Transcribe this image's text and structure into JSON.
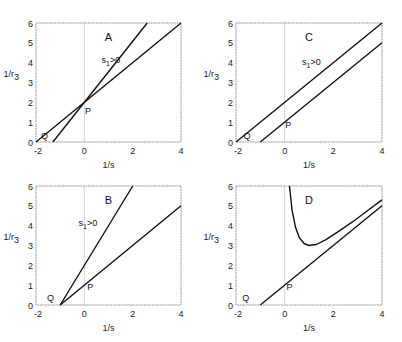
{
  "figure": {
    "panel_order": [
      "A",
      "C",
      "B",
      "D"
    ]
  },
  "chart_data": [
    {
      "panel": "A",
      "type": "line",
      "title": "A",
      "xlabel": "1/s",
      "ylabel": "1/r3",
      "xlim": [
        -2,
        4
      ],
      "ylim": [
        0,
        6
      ],
      "xticks": [
        -2,
        0,
        2,
        4
      ],
      "yticks": [
        0,
        1,
        2,
        3,
        4,
        5,
        6
      ],
      "grid": false,
      "vline_at_zero": true,
      "series": [
        {
          "name": "s1>0",
          "x": [
            -1.3,
            2.6
          ],
          "y": [
            0,
            6
          ]
        },
        {
          "name": "reference",
          "x": [
            -2,
            4
          ],
          "y": [
            0,
            6
          ]
        }
      ],
      "annotations": [
        {
          "text": "s",
          "sub": "1",
          "rest": ">0",
          "x": 1.1,
          "y": 4.0
        },
        {
          "text": "P",
          "x": 0.15,
          "y": 1.4
        },
        {
          "text": "Q",
          "x": -1.65,
          "y": 0.15
        }
      ]
    },
    {
      "panel": "C",
      "type": "line",
      "title": "C",
      "xlabel": "1/s",
      "ylabel": "1/r3",
      "xlim": [
        -2,
        4
      ],
      "ylim": [
        0,
        6
      ],
      "xticks": [
        -2,
        0,
        2,
        4
      ],
      "yticks": [
        0,
        1,
        2,
        3,
        4,
        5,
        6
      ],
      "grid": false,
      "vline_at_zero": true,
      "series": [
        {
          "name": "s1>0",
          "x": [
            -2,
            4
          ],
          "y": [
            0,
            6
          ]
        },
        {
          "name": "reference",
          "x": [
            -1,
            4
          ],
          "y": [
            0,
            5
          ]
        }
      ],
      "annotations": [
        {
          "text": "s",
          "sub": "1",
          "rest": ">0",
          "x": 1.1,
          "y": 3.9
        },
        {
          "text": "P",
          "x": 0.15,
          "y": 0.7
        },
        {
          "text": "Q",
          "x": -1.55,
          "y": 0.15
        }
      ]
    },
    {
      "panel": "B",
      "type": "line",
      "title": "B",
      "xlabel": "1/s",
      "ylabel": "1/r3",
      "xlim": [
        -2,
        4
      ],
      "ylim": [
        0,
        6
      ],
      "xticks": [
        -2,
        0,
        2,
        4
      ],
      "yticks": [
        0,
        1,
        2,
        3,
        4,
        5,
        6
      ],
      "grid": false,
      "vline_at_zero": true,
      "series": [
        {
          "name": "s1>0",
          "x": [
            -1,
            2
          ],
          "y": [
            0,
            6
          ]
        },
        {
          "name": "reference",
          "x": [
            -1,
            4
          ],
          "y": [
            0,
            5
          ]
        }
      ],
      "annotations": [
        {
          "text": "s",
          "sub": "1",
          "rest": ">0",
          "x": 0.15,
          "y": 4.0
        },
        {
          "text": "P",
          "x": 0.25,
          "y": 0.75
        },
        {
          "text": "Q",
          "x": -1.4,
          "y": 0.2
        }
      ]
    },
    {
      "panel": "D",
      "type": "line",
      "title": "D",
      "xlabel": "1/s",
      "ylabel": "1/r3",
      "xlim": [
        -2,
        4
      ],
      "ylim": [
        0,
        6
      ],
      "xticks": [
        -2,
        0,
        2,
        4
      ],
      "yticks": [
        0,
        1,
        2,
        3,
        4,
        5,
        6
      ],
      "grid": false,
      "vline_at_zero": true,
      "series": [
        {
          "name": "curve",
          "x": [
            0.2,
            0.3,
            0.45,
            0.6,
            0.8,
            1.0,
            1.3,
            1.7,
            2.2,
            2.8,
            3.4,
            4.0
          ],
          "y": [
            6.0,
            4.8,
            3.9,
            3.4,
            3.1,
            3.0,
            3.05,
            3.3,
            3.7,
            4.2,
            4.75,
            5.3
          ]
        },
        {
          "name": "reference",
          "x": [
            -1,
            4
          ],
          "y": [
            0,
            5
          ]
        }
      ],
      "annotations": [
        {
          "text": "P",
          "x": 0.2,
          "y": 0.75
        },
        {
          "text": "Q",
          "x": -1.6,
          "y": 0.2
        }
      ]
    }
  ],
  "layout": {
    "panels": {
      "A": {
        "left": 36,
        "top": 23,
        "right": 181,
        "bottom": 142,
        "letter_x": 1.0,
        "letter_y": 5.1
      },
      "C": {
        "left": 236,
        "top": 23,
        "right": 382,
        "bottom": 142,
        "letter_x": 1.0,
        "letter_y": 5.1
      },
      "B": {
        "left": 36,
        "top": 186,
        "right": 181,
        "bottom": 305,
        "letter_x": 1.0,
        "letter_y": 5.1
      },
      "D": {
        "left": 236,
        "top": 186,
        "right": 382,
        "bottom": 305,
        "letter_x": 1.0,
        "letter_y": 5.1
      }
    },
    "line_color": "#111111",
    "frame_color": "#9a9a9a",
    "zero_line_color": "#c8c8c8"
  }
}
